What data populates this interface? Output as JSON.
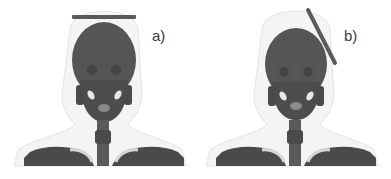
{
  "figure": {
    "panels": [
      {
        "label": "a)",
        "description": "head-and-neck skeleton model with horizontal plate above skull",
        "plate_orientation": "horizontal"
      },
      {
        "label": "b)",
        "description": "head-and-neck skeleton model with tilted plate beside upper right of skull",
        "plate_orientation": "tilted"
      }
    ],
    "colors": {
      "bone": "#4a4a4a",
      "skull": "#555555",
      "soft_tissue_outline": "#cfcfcf",
      "plate": "#5a5a5a",
      "highlight": "#e0e0e0",
      "background": "#ffffff"
    }
  }
}
